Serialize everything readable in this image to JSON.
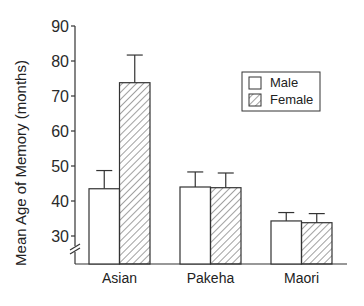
{
  "chart_data": {
    "type": "bar",
    "title": "",
    "xlabel": "",
    "ylabel": "Mean Age of Memory (months)",
    "ylim": [
      25,
      90
    ],
    "yticks": [
      30,
      40,
      50,
      60,
      70,
      80,
      90
    ],
    "axis_break": true,
    "grid": false,
    "legend_position": "upper right",
    "categories": [
      "Asian",
      "Pakeha",
      "Maori"
    ],
    "series": [
      {
        "name": "Male",
        "pattern": "open",
        "values": [
          43.5,
          44.0,
          34.3
        ],
        "error_upper": [
          48.7,
          48.3,
          36.7
        ]
      },
      {
        "name": "Female",
        "pattern": "hatched",
        "values": [
          73.8,
          43.8,
          33.8
        ],
        "error_upper": [
          81.7,
          48.0,
          36.4
        ]
      }
    ]
  },
  "legend": {
    "items": [
      {
        "label": "Male"
      },
      {
        "label": "Female"
      }
    ]
  },
  "colors": {
    "stroke": "#333333",
    "background": "#ffffff"
  }
}
